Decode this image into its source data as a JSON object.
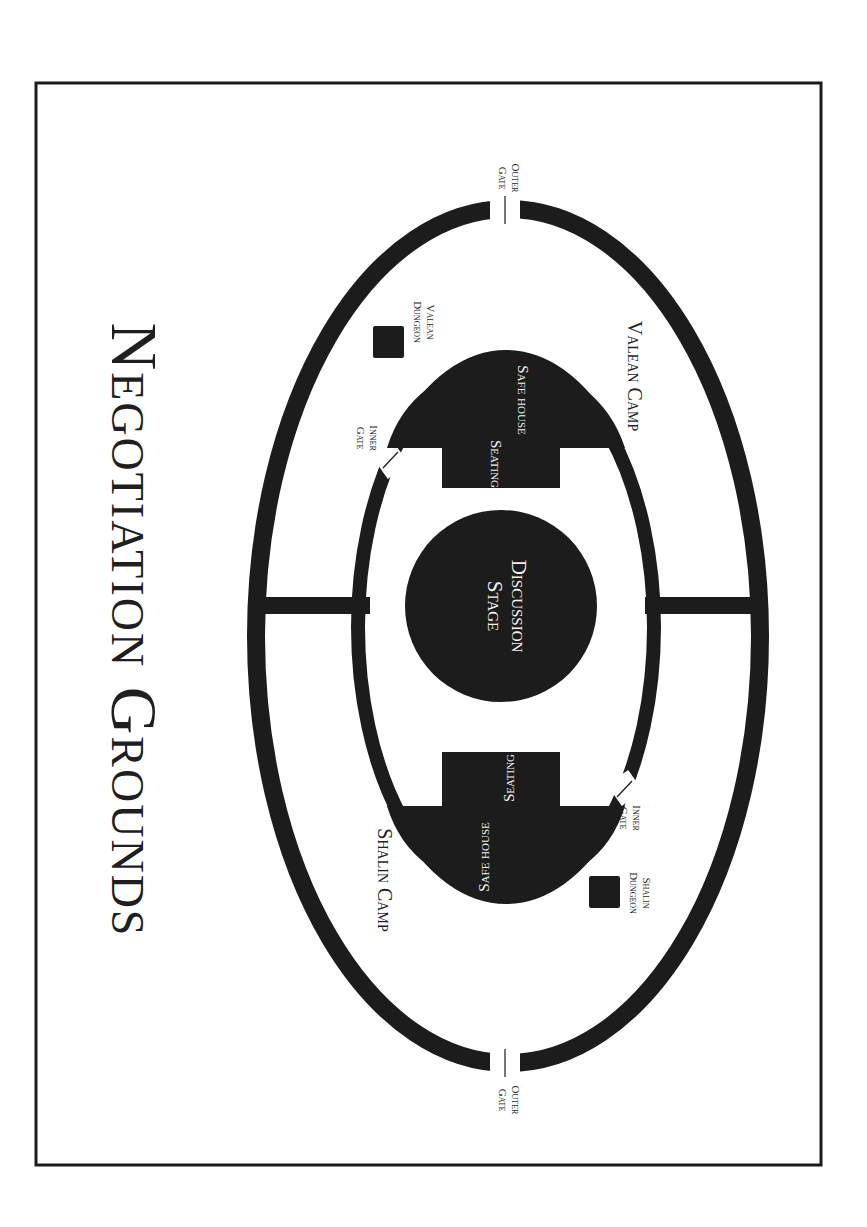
{
  "map": {
    "title": "Negotiation Grounds",
    "colors": {
      "ink": "#1c1c1c",
      "paper": "#ffffff",
      "label_on_ink": "#f2f2f2"
    },
    "orientation": "rotated 90° clockwise (text reads top-to-bottom)",
    "regions": {
      "valean_camp": "Valean Camp",
      "shalin_camp": "Shalin Camp",
      "discussion_stage": {
        "line1": "Discussion",
        "line2": "Stage"
      },
      "safe_house_top": "Safe house",
      "seating_top": "Seating",
      "safe_house_bottom": "Safe house",
      "seating_bottom": "Seating",
      "valean_dungeon": {
        "line1": "Valean",
        "line2": "Dungeon"
      },
      "shalin_dungeon": {
        "line1": "Shalin",
        "line2": "Dungeon"
      }
    },
    "gates": {
      "outer_top": {
        "line1": "Outer",
        "line2": "Gate"
      },
      "outer_bottom": {
        "line1": "Outer",
        "line2": "Gate"
      },
      "inner_top": {
        "line1": "Inner",
        "line2": "Gate"
      },
      "inner_bottom": {
        "line1": "Inner",
        "line2": "Gate"
      }
    }
  }
}
